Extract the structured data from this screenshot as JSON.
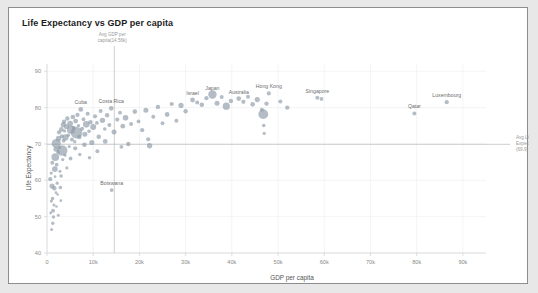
{
  "card": {
    "title": "Life Expectancy vs GDP per capita"
  },
  "chart_data": {
    "type": "scatter",
    "title": "Life Expectancy vs GDP per capita",
    "xlabel": "GDP per capita",
    "ylabel": "Life Expectancy",
    "xlim": [
      0,
      95000
    ],
    "ylim": [
      40,
      92
    ],
    "grid": true,
    "legend": "none",
    "point_color": "#8c9aa6",
    "point_opacity": 0.65,
    "size_encoding": "population",
    "xticks": [
      {
        "value": 0,
        "label": "0"
      },
      {
        "value": 10000,
        "label": "10k"
      },
      {
        "value": 20000,
        "label": "20k"
      },
      {
        "value": 30000,
        "label": "30k"
      },
      {
        "value": 40000,
        "label": "40k"
      },
      {
        "value": 50000,
        "label": "50k"
      },
      {
        "value": 60000,
        "label": "60k"
      },
      {
        "value": 70000,
        "label": "70k"
      },
      {
        "value": 80000,
        "label": "80k"
      },
      {
        "value": 90000,
        "label": "90k"
      }
    ],
    "yticks": [
      {
        "value": 90,
        "label": "90"
      },
      {
        "value": 80,
        "label": "80"
      },
      {
        "value": 70,
        "label": "70"
      },
      {
        "value": 60,
        "label": "60"
      },
      {
        "value": 50,
        "label": "50"
      },
      {
        "value": 40,
        "label": "40"
      }
    ],
    "reference_lines": [
      {
        "id": "avg-gdp",
        "orientation": "vertical",
        "value": 14560,
        "label": "Avg GDP per capita(14.56k)",
        "color": "#b9b9b9"
      },
      {
        "id": "avg-life-expectancy",
        "orientation": "horizontal",
        "value": 69.9,
        "label": "Avg Life Expectancy (69.9)",
        "color": "#b9b9b9"
      }
    ],
    "annotations": [
      {
        "label": "Cuba",
        "x": 7300,
        "y": 79.5
      },
      {
        "label": "Costa Rica",
        "x": 13900,
        "y": 79.8
      },
      {
        "label": "Israel",
        "x": 31500,
        "y": 82.1
      },
      {
        "label": "Japan",
        "x": 35800,
        "y": 83.6
      },
      {
        "label": "Australia",
        "x": 41500,
        "y": 82.5
      },
      {
        "label": "Hong Kong",
        "x": 48000,
        "y": 83.9
      },
      {
        "label": "Singapore",
        "x": 58500,
        "y": 82.7
      },
      {
        "label": "Qatar",
        "x": 79500,
        "y": 78.4
      },
      {
        "label": "Luxembourg",
        "x": 86500,
        "y": 81.5
      },
      {
        "label": "Botswana",
        "x": 14000,
        "y": 57.3
      }
    ],
    "points": [
      {
        "x": 700,
        "y": 60.3,
        "r": 2.1
      },
      {
        "x": 900,
        "y": 62.0,
        "r": 1.6
      },
      {
        "x": 1100,
        "y": 58.4,
        "r": 2.6
      },
      {
        "x": 1200,
        "y": 55.0,
        "r": 1.8
      },
      {
        "x": 1300,
        "y": 51.6,
        "r": 2.0
      },
      {
        "x": 1400,
        "y": 49.9,
        "r": 1.7
      },
      {
        "x": 1500,
        "y": 53.2,
        "r": 1.5
      },
      {
        "x": 1600,
        "y": 57.8,
        "r": 2.2
      },
      {
        "x": 1700,
        "y": 63.1,
        "r": 2.9
      },
      {
        "x": 1750,
        "y": 61.0,
        "r": 1.4
      },
      {
        "x": 1800,
        "y": 66.4,
        "r": 3.9
      },
      {
        "x": 1900,
        "y": 68.5,
        "r": 2.4
      },
      {
        "x": 2000,
        "y": 70.1,
        "r": 4.6
      },
      {
        "x": 2100,
        "y": 64.3,
        "r": 1.9
      },
      {
        "x": 2200,
        "y": 59.2,
        "r": 1.6
      },
      {
        "x": 2300,
        "y": 56.1,
        "r": 1.3
      },
      {
        "x": 2400,
        "y": 67.8,
        "r": 2.0
      },
      {
        "x": 2500,
        "y": 71.5,
        "r": 2.7
      },
      {
        "x": 2600,
        "y": 73.2,
        "r": 2.1
      },
      {
        "x": 2700,
        "y": 69.0,
        "r": 1.7
      },
      {
        "x": 2800,
        "y": 62.5,
        "r": 1.5
      },
      {
        "x": 2900,
        "y": 58.0,
        "r": 1.8
      },
      {
        "x": 3000,
        "y": 54.4,
        "r": 1.4
      },
      {
        "x": 3100,
        "y": 74.0,
        "r": 2.3
      },
      {
        "x": 3200,
        "y": 72.1,
        "r": 2.0
      },
      {
        "x": 3300,
        "y": 68.2,
        "r": 5.2
      },
      {
        "x": 3400,
        "y": 65.7,
        "r": 1.6
      },
      {
        "x": 3500,
        "y": 75.3,
        "r": 2.5
      },
      {
        "x": 3600,
        "y": 70.9,
        "r": 1.9
      },
      {
        "x": 3700,
        "y": 76.1,
        "r": 2.2
      },
      {
        "x": 3800,
        "y": 73.6,
        "r": 1.7
      },
      {
        "x": 3900,
        "y": 66.9,
        "r": 1.5
      },
      {
        "x": 4000,
        "y": 71.8,
        "r": 3.1
      },
      {
        "x": 4200,
        "y": 74.8,
        "r": 2.6
      },
      {
        "x": 4400,
        "y": 77.0,
        "r": 2.2
      },
      {
        "x": 4600,
        "y": 72.4,
        "r": 1.8
      },
      {
        "x": 4800,
        "y": 69.3,
        "r": 1.6
      },
      {
        "x": 5000,
        "y": 75.6,
        "r": 2.9
      },
      {
        "x": 5200,
        "y": 73.9,
        "r": 4.1
      },
      {
        "x": 5400,
        "y": 71.2,
        "r": 2.0
      },
      {
        "x": 5600,
        "y": 77.4,
        "r": 2.3
      },
      {
        "x": 5800,
        "y": 74.5,
        "r": 1.9
      },
      {
        "x": 6000,
        "y": 70.6,
        "r": 1.7
      },
      {
        "x": 6200,
        "y": 76.3,
        "r": 2.4
      },
      {
        "x": 6400,
        "y": 73.1,
        "r": 5.8
      },
      {
        "x": 6600,
        "y": 78.0,
        "r": 2.1
      },
      {
        "x": 6800,
        "y": 75.0,
        "r": 1.8
      },
      {
        "x": 7000,
        "y": 71.9,
        "r": 2.2
      },
      {
        "x": 7300,
        "y": 79.5,
        "r": 2.4
      },
      {
        "x": 7600,
        "y": 74.2,
        "r": 2.0
      },
      {
        "x": 7900,
        "y": 76.8,
        "r": 1.9
      },
      {
        "x": 8200,
        "y": 72.7,
        "r": 2.5
      },
      {
        "x": 8500,
        "y": 75.4,
        "r": 3.3
      },
      {
        "x": 8800,
        "y": 78.3,
        "r": 2.0
      },
      {
        "x": 9100,
        "y": 73.5,
        "r": 1.8
      },
      {
        "x": 9400,
        "y": 76.0,
        "r": 2.2
      },
      {
        "x": 9700,
        "y": 70.4,
        "r": 2.6
      },
      {
        "x": 10000,
        "y": 74.7,
        "r": 3.0
      },
      {
        "x": 10400,
        "y": 77.6,
        "r": 2.1
      },
      {
        "x": 10800,
        "y": 75.8,
        "r": 1.9
      },
      {
        "x": 11200,
        "y": 72.0,
        "r": 2.3
      },
      {
        "x": 11600,
        "y": 79.1,
        "r": 2.0
      },
      {
        "x": 12000,
        "y": 76.5,
        "r": 2.7
      },
      {
        "x": 12500,
        "y": 74.1,
        "r": 1.8
      },
      {
        "x": 13000,
        "y": 77.9,
        "r": 2.2
      },
      {
        "x": 13500,
        "y": 75.2,
        "r": 2.0
      },
      {
        "x": 13900,
        "y": 79.8,
        "r": 2.3
      },
      {
        "x": 14000,
        "y": 57.3,
        "r": 1.9
      },
      {
        "x": 14500,
        "y": 73.3,
        "r": 2.5
      },
      {
        "x": 15200,
        "y": 76.7,
        "r": 2.1
      },
      {
        "x": 15800,
        "y": 78.6,
        "r": 1.9
      },
      {
        "x": 16400,
        "y": 74.9,
        "r": 2.4
      },
      {
        "x": 17000,
        "y": 77.2,
        "r": 2.8
      },
      {
        "x": 17600,
        "y": 70.0,
        "r": 2.2
      },
      {
        "x": 18200,
        "y": 75.5,
        "r": 2.0
      },
      {
        "x": 19000,
        "y": 78.9,
        "r": 2.3
      },
      {
        "x": 19800,
        "y": 76.2,
        "r": 1.9
      },
      {
        "x": 20600,
        "y": 73.8,
        "r": 2.1
      },
      {
        "x": 21400,
        "y": 79.3,
        "r": 2.5
      },
      {
        "x": 22200,
        "y": 69.5,
        "r": 2.7
      },
      {
        "x": 23000,
        "y": 77.5,
        "r": 2.0
      },
      {
        "x": 24000,
        "y": 80.2,
        "r": 2.2
      },
      {
        "x": 25000,
        "y": 75.7,
        "r": 1.9
      },
      {
        "x": 26000,
        "y": 78.1,
        "r": 2.4
      },
      {
        "x": 27000,
        "y": 81.0,
        "r": 2.1
      },
      {
        "x": 28000,
        "y": 76.4,
        "r": 2.0
      },
      {
        "x": 29000,
        "y": 80.6,
        "r": 2.6
      },
      {
        "x": 30000,
        "y": 79.0,
        "r": 2.2
      },
      {
        "x": 31500,
        "y": 82.1,
        "r": 2.4
      },
      {
        "x": 32500,
        "y": 81.4,
        "r": 2.0
      },
      {
        "x": 33500,
        "y": 80.8,
        "r": 2.3
      },
      {
        "x": 34500,
        "y": 82.6,
        "r": 2.1
      },
      {
        "x": 35800,
        "y": 83.6,
        "r": 4.2
      },
      {
        "x": 36800,
        "y": 81.2,
        "r": 2.5
      },
      {
        "x": 37800,
        "y": 82.9,
        "r": 2.0
      },
      {
        "x": 38800,
        "y": 80.4,
        "r": 3.6
      },
      {
        "x": 39800,
        "y": 81.8,
        "r": 2.2
      },
      {
        "x": 41500,
        "y": 82.5,
        "r": 2.4
      },
      {
        "x": 42500,
        "y": 81.6,
        "r": 2.1
      },
      {
        "x": 43500,
        "y": 83.0,
        "r": 2.0
      },
      {
        "x": 44500,
        "y": 80.9,
        "r": 2.3
      },
      {
        "x": 45500,
        "y": 82.2,
        "r": 2.6
      },
      {
        "x": 46500,
        "y": 79.4,
        "r": 2.0
      },
      {
        "x": 47500,
        "y": 81.1,
        "r": 2.2
      },
      {
        "x": 48000,
        "y": 83.9,
        "r": 2.1
      },
      {
        "x": 46800,
        "y": 78.2,
        "r": 4.9
      },
      {
        "x": 46900,
        "y": 75.1,
        "r": 1.8
      },
      {
        "x": 47000,
        "y": 72.9,
        "r": 1.6
      },
      {
        "x": 50500,
        "y": 81.7,
        "r": 2.0
      },
      {
        "x": 52000,
        "y": 80.0,
        "r": 2.2
      },
      {
        "x": 58500,
        "y": 82.7,
        "r": 2.0
      },
      {
        "x": 59400,
        "y": 82.4,
        "r": 1.9
      },
      {
        "x": 79500,
        "y": 78.4,
        "r": 2.0
      },
      {
        "x": 86500,
        "y": 81.5,
        "r": 2.1
      },
      {
        "x": 1000,
        "y": 46.5,
        "r": 1.5
      },
      {
        "x": 1250,
        "y": 48.2,
        "r": 1.7
      },
      {
        "x": 800,
        "y": 51.0,
        "r": 1.4
      },
      {
        "x": 950,
        "y": 54.3,
        "r": 1.6
      },
      {
        "x": 2050,
        "y": 52.8,
        "r": 1.3
      },
      {
        "x": 2450,
        "y": 50.4,
        "r": 1.5
      },
      {
        "x": 1150,
        "y": 64.8,
        "r": 2.0
      },
      {
        "x": 1950,
        "y": 56.6,
        "r": 1.4
      },
      {
        "x": 3050,
        "y": 61.2,
        "r": 1.8
      },
      {
        "x": 4300,
        "y": 63.4,
        "r": 1.6
      },
      {
        "x": 5100,
        "y": 66.0,
        "r": 1.9
      },
      {
        "x": 6100,
        "y": 68.8,
        "r": 2.1
      },
      {
        "x": 7100,
        "y": 67.1,
        "r": 1.7
      },
      {
        "x": 8100,
        "y": 69.8,
        "r": 2.3
      },
      {
        "x": 9200,
        "y": 66.2,
        "r": 1.8
      },
      {
        "x": 10900,
        "y": 68.0,
        "r": 2.0
      },
      {
        "x": 12600,
        "y": 70.7,
        "r": 2.4
      },
      {
        "x": 16100,
        "y": 69.2,
        "r": 1.9
      },
      {
        "x": 21900,
        "y": 71.3,
        "r": 2.1
      }
    ]
  }
}
